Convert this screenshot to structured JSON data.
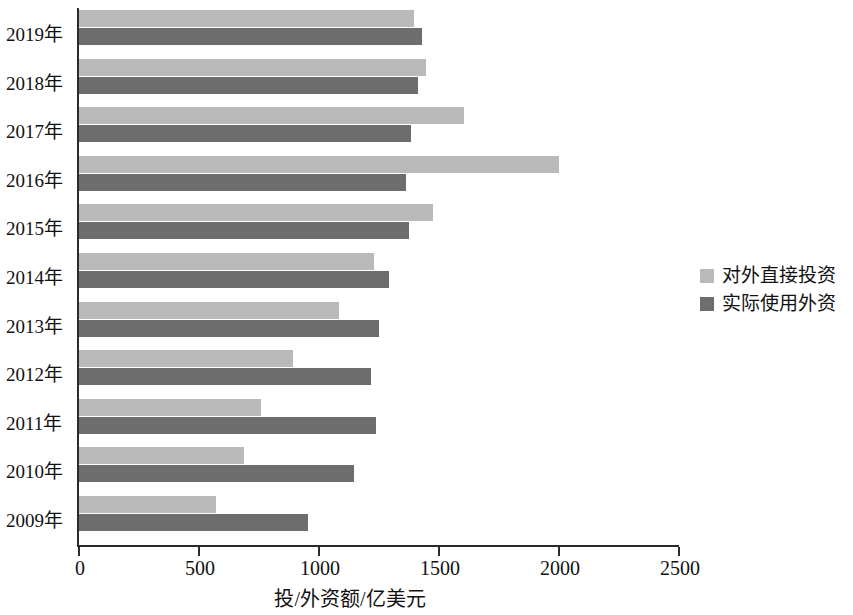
{
  "chart_data": {
    "type": "bar",
    "orientation": "horizontal",
    "title": "",
    "xlabel": "投/外资额/亿美元",
    "ylabel": "",
    "xlim": [
      0,
      2500
    ],
    "xticks": [
      0,
      500,
      1000,
      1500,
      2000,
      2500
    ],
    "xtick_labels": [
      "0",
      "500",
      "1000",
      "1500",
      "2000",
      "2500"
    ],
    "grid": false,
    "legend_position": "right",
    "categories": [
      "2019年",
      "2018年",
      "2017年",
      "2016年",
      "2015年",
      "2014年",
      "2013年",
      "2012年",
      "2011年",
      "2010年",
      "2009年"
    ],
    "series": [
      {
        "name": "对外直接投资",
        "color": "#b9b9b9",
        "values": [
          1396,
          1446,
          1604,
          2000,
          1475,
          1229,
          1083,
          892,
          758,
          688,
          571
        ]
      },
      {
        "name": "实际使用外资",
        "color": "#6d6d6d",
        "values": [
          1429,
          1412,
          1383,
          1363,
          1375,
          1292,
          1250,
          1217,
          1238,
          1146,
          954
        ]
      }
    ]
  },
  "legend": {
    "items": [
      {
        "label": "对外直接投资",
        "color": "#b9b9b9"
      },
      {
        "label": "实际使用外资",
        "color": "#6d6d6d"
      }
    ]
  },
  "axis": {
    "x_title": "投/外资额/亿美元"
  }
}
